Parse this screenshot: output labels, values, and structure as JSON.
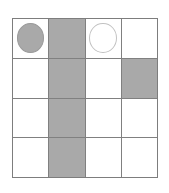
{
  "figure": {
    "background_color": "#ffffff",
    "grid_line_color": "#808080",
    "shaded_color": "#a9a9a9",
    "empty_color": "#ffffff",
    "token_fill_color": "#a9a9a9",
    "token_outline_color": "#c2c2c2",
    "rows": 4,
    "columns": 4
  },
  "grid": {
    "cells": [
      {
        "row": 1,
        "col": 1,
        "shaded": false,
        "token": "filled-circle",
        "label": ""
      },
      {
        "row": 1,
        "col": 2,
        "shaded": true,
        "token": "none",
        "label": ""
      },
      {
        "row": 1,
        "col": 3,
        "shaded": false,
        "token": "empty-circle",
        "label": ""
      },
      {
        "row": 1,
        "col": 4,
        "shaded": false,
        "token": "none",
        "label": ""
      },
      {
        "row": 2,
        "col": 1,
        "shaded": false,
        "token": "none",
        "label": ""
      },
      {
        "row": 2,
        "col": 2,
        "shaded": true,
        "token": "none",
        "label": ""
      },
      {
        "row": 2,
        "col": 3,
        "shaded": false,
        "token": "none",
        "label": ""
      },
      {
        "row": 2,
        "col": 4,
        "shaded": true,
        "token": "none",
        "label": ""
      },
      {
        "row": 3,
        "col": 1,
        "shaded": false,
        "token": "none",
        "label": ""
      },
      {
        "row": 3,
        "col": 2,
        "shaded": true,
        "token": "none",
        "label": ""
      },
      {
        "row": 3,
        "col": 3,
        "shaded": false,
        "token": "none",
        "label": ""
      },
      {
        "row": 3,
        "col": 4,
        "shaded": false,
        "token": "none",
        "label": ""
      },
      {
        "row": 4,
        "col": 1,
        "shaded": false,
        "token": "none",
        "label": ""
      },
      {
        "row": 4,
        "col": 2,
        "shaded": true,
        "token": "none",
        "label": ""
      },
      {
        "row": 4,
        "col": 3,
        "shaded": false,
        "token": "none",
        "label": ""
      },
      {
        "row": 4,
        "col": 4,
        "shaded": false,
        "token": "none",
        "label": ""
      }
    ]
  }
}
